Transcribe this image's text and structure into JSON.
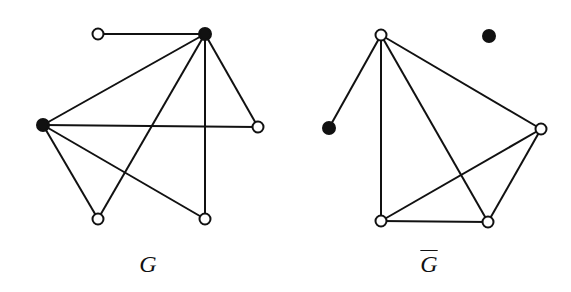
{
  "colors": {
    "stroke": "#111111",
    "filled_node": "#111111",
    "open_node_fill": "#ffffff",
    "background": "#ffffff"
  },
  "graphs": [
    {
      "id": "G",
      "label": "G",
      "label_overline": false,
      "label_pos": {
        "x": 148,
        "y": 252
      },
      "nodes": [
        {
          "id": "a",
          "x": 98,
          "y": 34,
          "filled": false
        },
        {
          "id": "b",
          "x": 205,
          "y": 34,
          "filled": true
        },
        {
          "id": "c",
          "x": 43,
          "y": 125,
          "filled": true
        },
        {
          "id": "d",
          "x": 258,
          "y": 127,
          "filled": false
        },
        {
          "id": "e",
          "x": 98,
          "y": 219,
          "filled": false
        },
        {
          "id": "f",
          "x": 205,
          "y": 219,
          "filled": false
        }
      ],
      "edges": [
        [
          "a",
          "b"
        ],
        [
          "b",
          "c"
        ],
        [
          "b",
          "e"
        ],
        [
          "b",
          "f"
        ],
        [
          "b",
          "d"
        ],
        [
          "c",
          "d"
        ],
        [
          "c",
          "e"
        ],
        [
          "c",
          "f"
        ]
      ]
    },
    {
      "id": "G_complement",
      "label": "G",
      "label_overline": true,
      "label_pos": {
        "x": 429,
        "y": 252
      },
      "nodes": [
        {
          "id": "a",
          "x": 381,
          "y": 35,
          "filled": false
        },
        {
          "id": "b",
          "x": 489,
          "y": 36,
          "filled": true
        },
        {
          "id": "c",
          "x": 329,
          "y": 128,
          "filled": true
        },
        {
          "id": "d",
          "x": 541,
          "y": 129,
          "filled": false
        },
        {
          "id": "e",
          "x": 381,
          "y": 221,
          "filled": false
        },
        {
          "id": "f",
          "x": 488,
          "y": 222,
          "filled": false
        }
      ],
      "edges": [
        [
          "a",
          "c"
        ],
        [
          "a",
          "e"
        ],
        [
          "a",
          "f"
        ],
        [
          "a",
          "d"
        ],
        [
          "d",
          "e"
        ],
        [
          "d",
          "f"
        ],
        [
          "e",
          "f"
        ]
      ]
    }
  ]
}
